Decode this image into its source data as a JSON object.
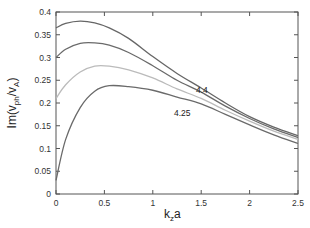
{
  "chart_data": {
    "type": "line",
    "title": "",
    "xlabel": "k_z a",
    "ylabel": "Im(v_ph/v_A)",
    "xlim": [
      0,
      2.5
    ],
    "ylim": [
      0,
      0.4
    ],
    "xticks": [
      0,
      0.5,
      1,
      1.5,
      2,
      2.5
    ],
    "xtick_labels": [
      "0",
      "0.5",
      "1",
      "1.5",
      "2",
      "2.5"
    ],
    "yticks": [
      0,
      0.05,
      0.1,
      0.15,
      0.2,
      0.25,
      0.3,
      0.35,
      0.4
    ],
    "ytick_labels": [
      "0",
      "0.05",
      "0.1",
      "0.15",
      "0.2",
      "0.25",
      "0.3",
      "0.35",
      "0.4"
    ],
    "grid": false,
    "legend": null,
    "x": [
      0,
      0.1,
      0.25,
      0.4,
      0.55,
      0.75,
      1.0,
      1.25,
      1.5,
      1.75,
      2.0,
      2.25,
      2.5
    ],
    "series": [
      {
        "name": "curve-1",
        "color": "#666666",
        "values": [
          0.365,
          0.375,
          0.38,
          0.376,
          0.365,
          0.342,
          0.302,
          0.265,
          0.233,
          0.2,
          0.17,
          0.147,
          0.128
        ]
      },
      {
        "name": "curve-2",
        "color": "#6a6a6a",
        "values": [
          0.3,
          0.318,
          0.331,
          0.332,
          0.327,
          0.311,
          0.282,
          0.25,
          0.224,
          0.193,
          0.166,
          0.143,
          0.124
        ]
      },
      {
        "name": "curve-3",
        "color": "#bbbbbb",
        "values": [
          0.21,
          0.24,
          0.268,
          0.281,
          0.281,
          0.273,
          0.255,
          0.231,
          0.21,
          0.184,
          0.16,
          0.138,
          0.12
        ]
      },
      {
        "name": "curve-4",
        "color": "#6a6a6a",
        "values": [
          0.03,
          0.12,
          0.19,
          0.226,
          0.238,
          0.236,
          0.228,
          0.213,
          0.198,
          0.175,
          0.152,
          0.13,
          0.111
        ]
      }
    ],
    "annotations": [
      {
        "text": "4.4",
        "x": 1.45,
        "y": 0.255
      },
      {
        "text": "4.25",
        "x": 1.2,
        "y": 0.18
      }
    ]
  },
  "labels": {
    "ylabel_main": "Im(v",
    "ylabel_sub1": "ph",
    "ylabel_mid": "/v",
    "ylabel_sub2": "A",
    "ylabel_end": ")",
    "xlabel_main": "k",
    "xlabel_sub": "z",
    "xlabel_end": "a",
    "annot_1": "4.4",
    "annot_2": "4.25"
  }
}
